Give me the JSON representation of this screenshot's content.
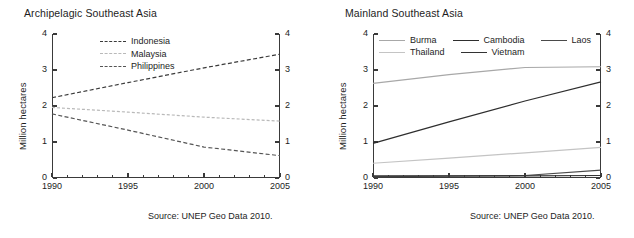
{
  "figure": {
    "panels": [
      {
        "id": "archipelagic",
        "title": "Archipelagic Southeast Asia",
        "ylabel": "Million hectares",
        "source": "Source: UNEP Geo Data 2010.",
        "legend_items": [
          {
            "label": "Indonesia",
            "color": "#3a3a3a",
            "dash": "4,2.4"
          },
          {
            "label": "Malaysia",
            "color": "#b9b9b9",
            "dash": "3,2"
          },
          {
            "label": "Philippines",
            "color": "#555555",
            "dash": "4,2.4"
          }
        ]
      },
      {
        "id": "mainland",
        "title": "Mainland Southeast Asia",
        "ylabel": "Million hectares",
        "source": "Source: UNEP Geo Data 2010.",
        "legend_items": [
          {
            "label": "Burma",
            "color": "#a8a8a8",
            "dash": "none"
          },
          {
            "label": "Cambodia",
            "color": "#2e2e2e",
            "dash": "none"
          },
          {
            "label": "Laos",
            "color": "#4a4a4a",
            "dash": "none"
          },
          {
            "label": "Thailand",
            "color": "#c4c4c4",
            "dash": "none"
          },
          {
            "label": "Vietnam",
            "color": "#333333",
            "dash": "none"
          }
        ]
      }
    ]
  },
  "chart_data": [
    {
      "type": "line",
      "title": "Archipelagic Southeast Asia",
      "xlabel": "",
      "ylabel": "Million hectares",
      "xlim": [
        1990,
        2005
      ],
      "ylim": [
        0,
        4
      ],
      "yticks": [
        0,
        1,
        2,
        3,
        4
      ],
      "xticks": [
        1990,
        1995,
        2000,
        2005
      ],
      "right_axis_yticks": [
        0,
        1,
        2,
        3,
        4
      ],
      "grid": false,
      "legend_position": "inside-top-center",
      "source": "Source: UNEP Geo Data 2010.",
      "x": [
        1990,
        1995,
        2000,
        2005
      ],
      "series": [
        {
          "name": "Indonesia",
          "values": [
            2.23,
            2.65,
            3.06,
            3.44
          ],
          "style": "dashed",
          "color": "#3a3a3a"
        },
        {
          "name": "Malaysia",
          "values": [
            1.96,
            1.83,
            1.69,
            1.58
          ],
          "style": "dotted",
          "color": "#b9b9b9"
        },
        {
          "name": "Philippines",
          "values": [
            1.78,
            1.33,
            0.86,
            0.62
          ],
          "style": "dashed",
          "color": "#555555"
        }
      ]
    },
    {
      "type": "line",
      "title": "Mainland Southeast Asia",
      "xlabel": "",
      "ylabel": "Million hectares",
      "xlim": [
        1990,
        2005
      ],
      "ylim": [
        0,
        4
      ],
      "yticks": [
        0,
        1,
        2,
        3,
        4
      ],
      "xticks": [
        1990,
        1995,
        2000,
        2005
      ],
      "right_axis_yticks": [
        0,
        1,
        2,
        3,
        4
      ],
      "grid": false,
      "legend_position": "inside-top-center",
      "source": "Source: UNEP Geo Data 2010.",
      "x": [
        1990,
        1995,
        2000,
        2005
      ],
      "series": [
        {
          "name": "Burma",
          "values": [
            2.63,
            2.87,
            3.07,
            3.09
          ],
          "style": "solid",
          "color": "#a8a8a8"
        },
        {
          "name": "Cambodia",
          "values": [
            0.96,
            1.56,
            2.14,
            2.67
          ],
          "style": "solid",
          "color": "#2e2e2e"
        },
        {
          "name": "Laos",
          "values": [
            0.04,
            0.05,
            0.07,
            0.22
          ],
          "style": "solid",
          "color": "#4a4a4a"
        },
        {
          "name": "Thailand",
          "values": [
            0.41,
            0.55,
            0.7,
            0.85
          ],
          "style": "solid",
          "color": "#c4c4c4"
        },
        {
          "name": "Vietnam",
          "values": [
            0.06,
            0.06,
            0.06,
            0.07
          ],
          "style": "solid",
          "color": "#333333"
        }
      ]
    }
  ]
}
